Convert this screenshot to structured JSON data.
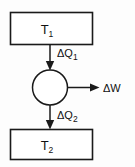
{
  "figure": {
    "type": "heat-engine-schematic",
    "background_color": "#fdfdfd",
    "line_color": "#1a1a1a",
    "hot_reservoir": {
      "label_main": "T",
      "label_sub": "1"
    },
    "cold_reservoir": {
      "label_main": "T",
      "label_sub": "2"
    },
    "engine": {
      "shape": "circle"
    },
    "heat_in": {
      "label_main": "ΔQ",
      "label_sub": "1",
      "direction": "down"
    },
    "heat_out": {
      "label_main": "ΔQ",
      "label_sub": "2",
      "direction": "down"
    },
    "work_out": {
      "label_main": "ΔW",
      "label_sub": "",
      "direction": "right"
    }
  }
}
